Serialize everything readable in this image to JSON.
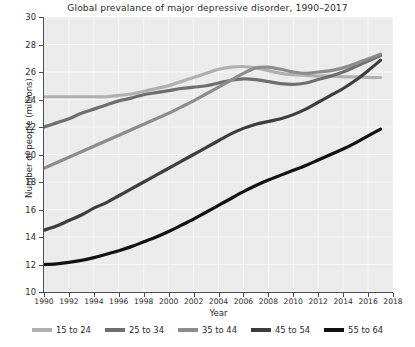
{
  "chart_data": {
    "type": "line",
    "title": "Global prevalance of major depressive disorder, 1990–2017",
    "xlabel": "Year",
    "ylabel": "Number of people (millions)",
    "xlim": [
      1990,
      2018
    ],
    "ylim": [
      10,
      30
    ],
    "grid": true,
    "legend_position": "bottom",
    "xticks": [
      1990,
      1992,
      1994,
      1996,
      1998,
      2000,
      2002,
      2004,
      2006,
      2008,
      2010,
      2012,
      2014,
      2016,
      2018
    ],
    "xtick_labels": [
      "1990",
      "1992",
      "1994",
      "1996",
      "1998",
      "2000",
      "2002",
      "2004",
      "2006",
      "2008",
      "2010",
      "2012",
      "2014",
      "2016",
      "2018"
    ],
    "yticks": [
      10,
      12,
      14,
      16,
      18,
      20,
      22,
      24,
      26,
      28,
      30
    ],
    "ytick_labels": [
      "10",
      "12",
      "14",
      "16",
      "18",
      "20",
      "22",
      "24",
      "26",
      "28",
      "30"
    ],
    "x": [
      1990,
      1991,
      1992,
      1993,
      1994,
      1995,
      1996,
      1997,
      1998,
      1999,
      2000,
      2001,
      2002,
      2003,
      2004,
      2005,
      2006,
      2007,
      2008,
      2009,
      2010,
      2011,
      2012,
      2013,
      2014,
      2015,
      2016,
      2017
    ],
    "series": [
      {
        "name": "15 to 24",
        "color": "#b0b0b0",
        "values": [
          24.2,
          24.2,
          24.2,
          24.2,
          24.2,
          24.2,
          24.3,
          24.4,
          24.6,
          24.8,
          25.0,
          25.3,
          25.6,
          25.9,
          26.2,
          26.35,
          26.4,
          26.3,
          26.1,
          25.9,
          25.8,
          25.75,
          25.7,
          25.7,
          25.65,
          25.65,
          25.6,
          25.6
        ]
      },
      {
        "name": "25 to 34",
        "color": "#6e6e6e",
        "values": [
          22.0,
          22.3,
          22.6,
          23.0,
          23.3,
          23.6,
          23.9,
          24.1,
          24.35,
          24.5,
          24.65,
          24.8,
          24.9,
          25.0,
          25.2,
          25.4,
          25.5,
          25.45,
          25.3,
          25.15,
          25.1,
          25.2,
          25.45,
          25.7,
          26.0,
          26.4,
          26.8,
          27.2
        ]
      },
      {
        "name": "35 to 44",
        "color": "#8c8c8c",
        "values": [
          19.0,
          19.4,
          19.8,
          20.2,
          20.6,
          21.0,
          21.4,
          21.8,
          22.2,
          22.6,
          23.0,
          23.45,
          23.9,
          24.4,
          24.9,
          25.4,
          25.9,
          26.3,
          26.35,
          26.2,
          26.0,
          25.9,
          26.0,
          26.1,
          26.3,
          26.6,
          26.95,
          27.3
        ]
      },
      {
        "name": "45 to 54",
        "color": "#3d3d3d",
        "values": [
          14.5,
          14.8,
          15.2,
          15.6,
          16.1,
          16.5,
          17.0,
          17.5,
          18.0,
          18.5,
          19.0,
          19.5,
          20.0,
          20.5,
          21.0,
          21.5,
          21.9,
          22.2,
          22.4,
          22.6,
          22.9,
          23.3,
          23.8,
          24.3,
          24.8,
          25.4,
          26.1,
          26.85
        ]
      },
      {
        "name": "55 to 64",
        "color": "#111111",
        "values": [
          12.0,
          12.05,
          12.15,
          12.3,
          12.5,
          12.75,
          13.0,
          13.3,
          13.65,
          14.0,
          14.4,
          14.85,
          15.3,
          15.8,
          16.3,
          16.8,
          17.3,
          17.75,
          18.15,
          18.5,
          18.85,
          19.2,
          19.6,
          20.0,
          20.4,
          20.85,
          21.35,
          21.85
        ]
      }
    ]
  },
  "legend": {
    "items": [
      {
        "label": "15 to 24",
        "color": "#b0b0b0"
      },
      {
        "label": "25 to 34",
        "color": "#6e6e6e"
      },
      {
        "label": "35 to 44",
        "color": "#8c8c8c"
      },
      {
        "label": "45 to 54",
        "color": "#3d3d3d"
      },
      {
        "label": "55 to 64",
        "color": "#111111"
      }
    ]
  },
  "style": {
    "plot_background": "#ebebeb",
    "grid_color": "#f7f7f7",
    "axis_color": "#4d4d4d",
    "text_color": "#2a2a2a"
  }
}
